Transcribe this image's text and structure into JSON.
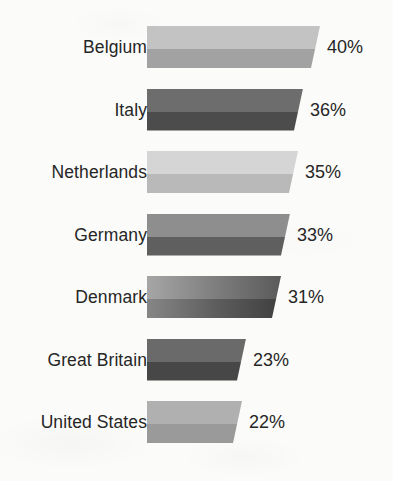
{
  "chart_data": {
    "type": "bar",
    "orientation": "horizontal",
    "title": "",
    "subtitle": "",
    "xlabel": "",
    "ylabel": "",
    "xlim": [
      0,
      40
    ],
    "grid": false,
    "legend": null,
    "value_suffix": "%",
    "categories": [
      "Belgium",
      "Italy",
      "Netherlands",
      "Germany",
      "Denmark",
      "Great Britain",
      "United States"
    ],
    "values": [
      40,
      36,
      35,
      33,
      31,
      23,
      22
    ],
    "value_labels": [
      "40%",
      "36%",
      "35%",
      "33%",
      "31%",
      "23%",
      "22%"
    ],
    "bars": [
      {
        "category": "Belgium",
        "value": 40,
        "label": "40%",
        "top_color": "#c3c3c3",
        "bottom_color": "#a2a2a2"
      },
      {
        "category": "Italy",
        "value": 36,
        "label": "36%",
        "top_color": "#6d6d6d",
        "bottom_color": "#4c4c4c"
      },
      {
        "category": "Netherlands",
        "value": 35,
        "label": "35%",
        "top_color": "#d5d5d5",
        "bottom_color": "#b9b9b9"
      },
      {
        "category": "Germany",
        "value": 33,
        "label": "33%",
        "top_color": "#8e8e8e",
        "bottom_color": "#5f5f5f"
      },
      {
        "category": "Denmark",
        "value": 31,
        "label": "31%",
        "top_color": "#7b7b7b",
        "bottom_color": "#5b5b5b"
      },
      {
        "category": "Great Britain",
        "value": 23,
        "label": "23%",
        "top_color": "#6a6a6a",
        "bottom_color": "#474747"
      },
      {
        "category": "United States",
        "value": 22,
        "label": "22%",
        "top_color": "#b0b0b0",
        "bottom_color": "#9a9a9a"
      }
    ],
    "background_color": "#fbfbf9",
    "text_color": "#262626"
  }
}
